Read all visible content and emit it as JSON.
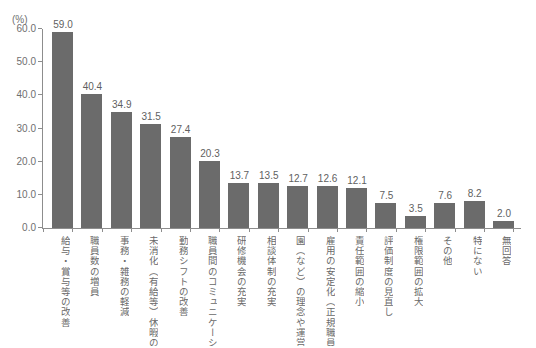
{
  "chart_data": {
    "type": "bar",
    "title": "",
    "xlabel": "",
    "ylabel": "",
    "unit_label": "(%)",
    "ylim": [
      0.0,
      60.0
    ],
    "ytick_labels": [
      "60.0",
      "50.0",
      "40.0",
      "30.0",
      "20.0",
      "10.0",
      "0.0"
    ],
    "ytick_values": [
      60.0,
      50.0,
      40.0,
      30.0,
      20.0,
      10.0,
      0.0
    ],
    "grid": false,
    "legend": "none",
    "orientation": "vertical",
    "bar_color": "#6b6b6b",
    "axis_color": "#8d8d8d",
    "text_color": "#6a6a6a",
    "categories": [
      "給与・賞与等の改善",
      "職員数の増員",
      "事務・雑務の軽減",
      "未消化（有給等）休暇の改善",
      "勤務シフトの改善",
      "職員間のコミュニケーション",
      "研修機会の充実",
      "相談体制の充実",
      "園（など）の理念や運営方針",
      "雇用の安定化（正規職員登用）",
      "責任範囲の縮小",
      "評価制度の見直し",
      "権限範囲の拡大",
      "その他",
      "特にない",
      "無回答"
    ],
    "values": [
      59.0,
      40.4,
      34.9,
      31.5,
      27.4,
      20.3,
      13.7,
      13.5,
      12.7,
      12.6,
      12.1,
      7.5,
      3.5,
      7.6,
      8.2,
      2.0
    ],
    "value_labels": [
      "59.0",
      "40.4",
      "34.9",
      "31.5",
      "27.4",
      "20.3",
      "13.7",
      "13.5",
      "12.7",
      "12.6",
      "12.1",
      "7.5",
      "3.5",
      "7.6",
      "8.2",
      "2.0"
    ]
  }
}
